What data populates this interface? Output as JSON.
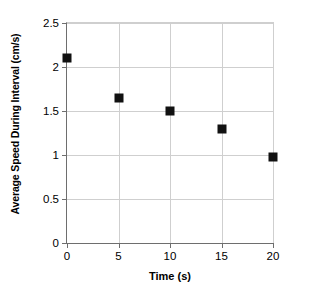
{
  "chart_data": {
    "type": "scatter",
    "title": "",
    "xlabel": "Time (s)",
    "ylabel": "Average Speed During Interval (cm/s)",
    "x": [
      0,
      5,
      10,
      15,
      20
    ],
    "values": [
      2.1,
      1.65,
      1.5,
      1.3,
      0.98
    ],
    "series": [
      {
        "name": "Average speed",
        "marker": "filled-square",
        "color": "#111111",
        "points": [
          {
            "x": 0,
            "y": 2.1
          },
          {
            "x": 5,
            "y": 1.65
          },
          {
            "x": 10,
            "y": 1.5
          },
          {
            "x": 15,
            "y": 1.3
          },
          {
            "x": 20,
            "y": 0.98
          }
        ]
      }
    ],
    "xlim": [
      0,
      20
    ],
    "ylim": [
      0,
      2.5
    ],
    "xticks": [
      0,
      5,
      10,
      15,
      20
    ],
    "yticks": [
      0,
      0.5,
      1,
      1.5,
      2,
      2.5
    ],
    "xticklabels": [
      "0",
      "5",
      "10",
      "15",
      "20"
    ],
    "yticklabels": [
      "0",
      "0.5",
      "1",
      "1.5",
      "2",
      "2.5"
    ],
    "grid": true,
    "grid_axis": "both",
    "grid_color": "#cfcfcf",
    "legend": false,
    "legend_position": "none",
    "background": "#ffffff",
    "axis_color": "#6e6e6e"
  },
  "figure": {
    "title_remnant": ""
  }
}
